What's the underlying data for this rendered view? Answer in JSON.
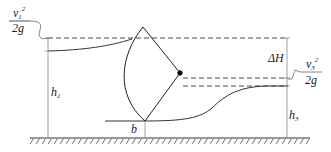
{
  "diagram": {
    "type": "radial-gate-flow",
    "labels": {
      "v1_num": "v",
      "v1_sub": "1",
      "v1_sup": "2",
      "v1_den": "2g",
      "v3_num": "v",
      "v3_sub": "3",
      "v3_sup": "2",
      "v3_den": "2g",
      "h1": "h",
      "h1_sub": "1",
      "h3": "h",
      "h3_sub": "3",
      "dH": "ΔH",
      "b": "b"
    },
    "colors": {
      "line": "#333333",
      "dim": "#888888"
    }
  }
}
